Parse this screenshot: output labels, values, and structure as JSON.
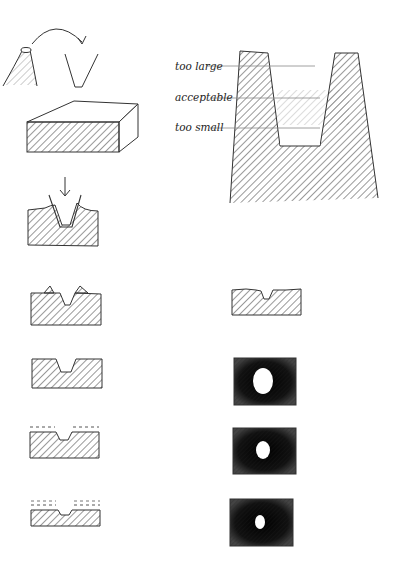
{
  "figure": {
    "stroke_color": "#333333",
    "fill_dark": "#1a1a1a"
  },
  "tooth_diagram": {
    "labels": [
      {
        "id": "too_large",
        "text": "too large"
      },
      {
        "id": "acceptable",
        "text": "acceptable"
      },
      {
        "id": "too_small",
        "text": "too small"
      }
    ]
  },
  "left_column": [
    {
      "id": "tool-flip",
      "caption": "cone tool flipped"
    },
    {
      "id": "block",
      "caption": "blank block"
    },
    {
      "id": "press",
      "caption": "tool pressed into block"
    },
    {
      "id": "burrs",
      "caption": "groove with raised burrs"
    },
    {
      "id": "groove",
      "caption": "clean groove"
    },
    {
      "id": "sand1",
      "caption": "surface removed (dashed)"
    },
    {
      "id": "sand2",
      "caption": "more surface removed (dashed)"
    }
  ],
  "right_column": [
    {
      "id": "rough-groove",
      "caption": "rough groove block"
    },
    {
      "id": "hole-large",
      "caption": "large hole"
    },
    {
      "id": "hole-medium",
      "caption": "medium hole"
    },
    {
      "id": "hole-small",
      "caption": "small hole"
    }
  ]
}
